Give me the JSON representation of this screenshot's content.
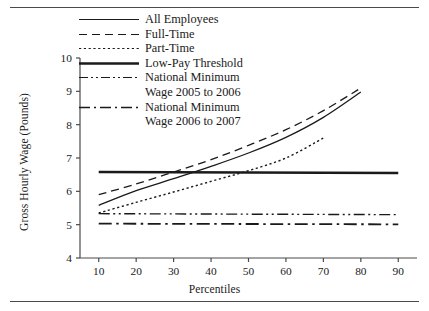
{
  "figure": {
    "top_rule": "horizontal-rule",
    "bottom_rule": "horizontal-rule"
  },
  "axes": {
    "ylabel": "Gross Hourly Wage (Pounds)",
    "xlabel": "Percentiles",
    "yticks": [
      4,
      5,
      6,
      7,
      8,
      9,
      10
    ],
    "xticks": [
      10,
      20,
      30,
      40,
      50,
      60,
      70,
      80,
      90
    ]
  },
  "legend": [
    {
      "label": "All Employees",
      "style": "solid-thin"
    },
    {
      "label": "Full-Time",
      "style": "dashed"
    },
    {
      "label": "Part-Time",
      "style": "dotted"
    },
    {
      "label": "Low-Pay Threshold",
      "style": "solid-thick"
    },
    {
      "label": "National Minimum",
      "label2": "Wage 2005 to 2006",
      "style": "dash-dot-dot"
    },
    {
      "label": "National Minimum",
      "label2": "Wage 2006 to 2007",
      "style": "dash-dot"
    }
  ],
  "colors": {
    "line": "#1a1a1a",
    "axis": "#4a4a4a",
    "background": "#ffffff"
  },
  "chart_data": {
    "type": "line",
    "title": "",
    "xlabel": "Percentiles",
    "ylabel": "Gross Hourly Wage (Pounds)",
    "xlim": [
      5,
      95
    ],
    "ylim": [
      4,
      10
    ],
    "xticks": [
      10,
      20,
      30,
      40,
      50,
      60,
      70,
      80,
      90
    ],
    "yticks": [
      4,
      5,
      6,
      7,
      8,
      9,
      10
    ],
    "grid": false,
    "legend_position": "top-left-inside",
    "series": [
      {
        "name": "All Employees",
        "style": "solid-thin",
        "x": [
          10,
          20,
          30,
          40,
          50,
          60,
          70,
          80
        ],
        "values": [
          5.58,
          6.02,
          6.38,
          6.75,
          7.15,
          7.62,
          8.22,
          8.98
        ]
      },
      {
        "name": "Full-Time",
        "style": "dashed",
        "x": [
          10,
          20,
          30,
          40,
          50,
          60,
          70,
          80
        ],
        "values": [
          5.9,
          6.22,
          6.58,
          6.95,
          7.38,
          7.85,
          8.42,
          9.1
        ]
      },
      {
        "name": "Part-Time",
        "style": "dotted",
        "x": [
          10,
          20,
          30,
          40,
          50,
          60,
          70
        ],
        "values": [
          5.35,
          5.67,
          5.98,
          6.3,
          6.62,
          7.0,
          7.6
        ]
      },
      {
        "name": "Low-Pay Threshold",
        "style": "solid-thick",
        "x": [
          10,
          90
        ],
        "values": [
          6.58,
          6.55
        ]
      },
      {
        "name": "National Minimum Wage 2005 to 2006",
        "style": "dash-dot-dot",
        "x": [
          10,
          90
        ],
        "values": [
          5.33,
          5.3
        ]
      },
      {
        "name": "National Minimum Wage 2006 to 2007",
        "style": "dash-dot",
        "x": [
          10,
          90
        ],
        "values": [
          5.03,
          5.01
        ]
      }
    ]
  }
}
